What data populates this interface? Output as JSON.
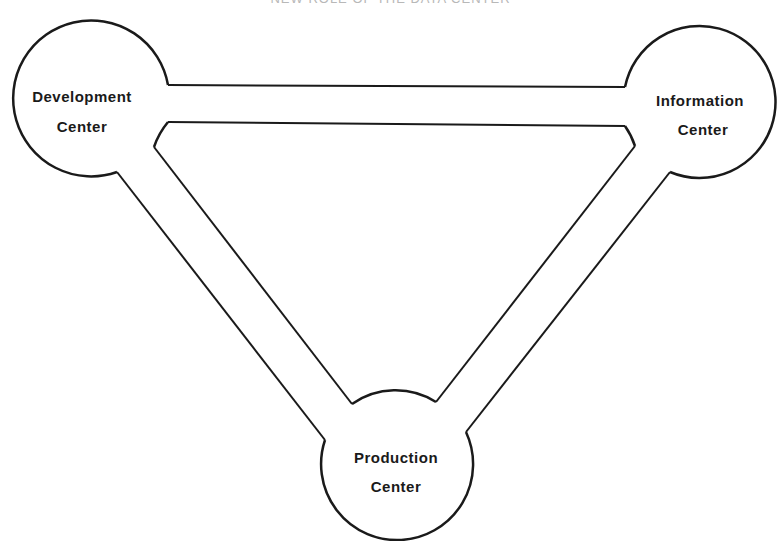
{
  "title": "NEW ROLE OF THE DATA CENTER",
  "nodes": [
    {
      "id": "development",
      "line1": "Development",
      "line2": "Center"
    },
    {
      "id": "information",
      "line1": "Information",
      "line2": "Center"
    },
    {
      "id": "production",
      "line1": "Production",
      "line2": "Center"
    }
  ],
  "colors": {
    "stroke": "#1a1a1a",
    "background": "#ffffff"
  }
}
